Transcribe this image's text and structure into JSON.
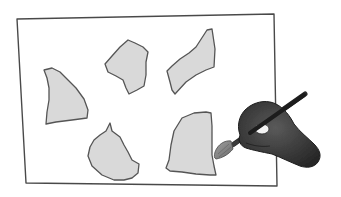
{
  "illustration": {
    "description": "Hand-drawn sketch of a hand holding a paintbrush painting irregular gray shapes inside a rectangular frame",
    "colors": {
      "background": "#ffffff",
      "outline": "#4a4a4a",
      "shape_fill": "#d9d9d9",
      "hand_fill": "#3a3a3a",
      "brush_handle": "#2a2a2a",
      "brush_tip": "#8a8a8a"
    },
    "frame": {
      "points": "17,19 274,14 277,186 26,183"
    },
    "shapes": [
      {
        "name": "shape-left-triangle",
        "points": "44,70 52,68 60,72 68,80 76,88 84,99 88,110 87,118 72,120 56,122 46,124 47,112 49,100 49,88 47,78"
      },
      {
        "name": "shape-top-blob",
        "points": "105,64 112,56 120,47 128,40 135,43 143,47 148,52 146,62 146,75 144,86 137,90 129,94 126,88 123,80 116,76 108,72"
      },
      {
        "name": "shape-top-right-slab",
        "points": "167,71 172,66 180,59 189,53 196,47 207,30 212,29 215,49 214,67 206,70 196,75 186,82 175,94 172,90 170,82"
      },
      {
        "name": "shape-bottom-blob",
        "points": "90,147 94,140 100,135 106,131 110,123 112,131 116,134 120,137 124,145 128,152 132,160 139,164 138,173 132,178 124,180 114,180 102,175 92,166 88,156"
      },
      {
        "name": "shape-bottom-right-bucket",
        "points": "171,145 174,131 182,118 194,113 206,112 211,113 212,126 212,138 212,155 214,166 216,175 210,175 196,174 182,172 170,171 166,168 169,160"
      }
    ],
    "hand": {
      "brush_tip": {
        "cx": 222,
        "cy": 150
      },
      "brush_handle": {
        "from": "232,145",
        "to": "305,93"
      }
    }
  }
}
